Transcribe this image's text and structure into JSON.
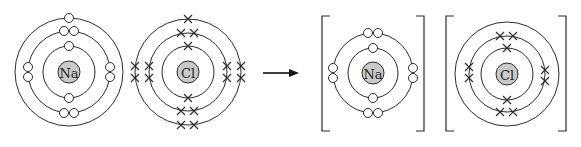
{
  "diagram": {
    "colors": {
      "nucleus_fill": "#c9c9c9",
      "stroke": "#2b2b2b",
      "background": "#ffffff"
    },
    "reactants": [
      {
        "id": "na-atom",
        "symbol": "Na",
        "center": [
          69,
          72
        ],
        "shell_radii": [
          26,
          41,
          54
        ],
        "electron_style": "dot",
        "shells": [
          {
            "count": 2,
            "positions": [
              "top",
              "bottom"
            ]
          },
          {
            "count": 8,
            "positions": [
              "top-pair",
              "bottom-pair",
              "left-pair",
              "right-pair"
            ]
          },
          {
            "count": 1,
            "positions": [
              "top"
            ]
          }
        ]
      },
      {
        "id": "cl-atom",
        "symbol": "Cl",
        "center": [
          188,
          72
        ],
        "shell_radii": [
          26,
          39,
          53
        ],
        "electron_style": "cross",
        "shells": [
          {
            "count": 2,
            "positions": [
              "top",
              "bottom"
            ]
          },
          {
            "count": 8,
            "positions": [
              "top-pair",
              "bottom-pair",
              "left-pair",
              "right-pair"
            ]
          },
          {
            "count": 7,
            "positions": [
              "top",
              "bottom-pair",
              "left-pair",
              "right-pair"
            ]
          }
        ]
      }
    ],
    "arrow": {
      "from": [
        263,
        73
      ],
      "to": [
        298,
        73
      ],
      "label": ""
    },
    "products": [
      {
        "id": "na-ion",
        "symbol": "Na",
        "bracketed": true,
        "bracket": {
          "left": 322,
          "right": 424,
          "top": 16,
          "bottom": 131
        },
        "center": [
          373,
          73
        ],
        "shell_radii": [
          25,
          40
        ],
        "electron_style": "dot",
        "shells": [
          {
            "count": 2,
            "positions": [
              "top",
              "bottom"
            ]
          },
          {
            "count": 8,
            "positions": [
              "top-pair",
              "bottom-pair",
              "left-pair",
              "right-pair"
            ]
          }
        ]
      },
      {
        "id": "cl-ion",
        "symbol": "Cl",
        "bracketed": true,
        "bracket": {
          "left": 446,
          "right": 566,
          "top": 16,
          "bottom": 131
        },
        "center": [
          507,
          74
        ],
        "shell_radii": [
          26,
          38,
          52
        ],
        "electron_style": "cross",
        "shells": [
          {
            "count": 2,
            "positions": [
              "top",
              "bottom"
            ]
          },
          {
            "count": 8,
            "positions": [
              "top-pair",
              "bottom-pair",
              "left-pair",
              "right-pair"
            ]
          },
          {
            "count": 0,
            "positions": []
          }
        ]
      }
    ]
  },
  "labels": {
    "na_atom": "Na",
    "cl_atom": "Cl",
    "na_ion": "Na",
    "cl_ion": "Cl"
  }
}
